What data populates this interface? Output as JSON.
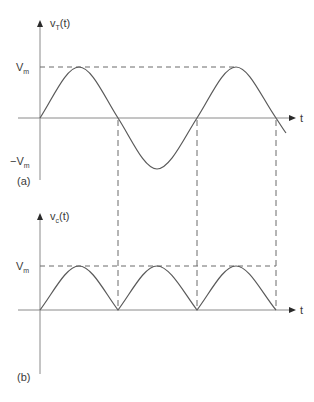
{
  "figure": {
    "panel_a": {
      "tag": "(a)",
      "y_label_main": "v",
      "y_label_sub": "T",
      "y_label_arg": "(t)",
      "x_label": "t",
      "pos_level_main": "V",
      "pos_level_sub": "m",
      "neg_level_main": "−V",
      "neg_level_sub": "m",
      "waveform": "sine, 2 periods shown"
    },
    "panel_b": {
      "tag": "(b)",
      "y_label_main": "v",
      "y_label_sub": "c",
      "y_label_arg": "(t)",
      "x_label": "t",
      "pos_level_main": "V",
      "pos_level_sub": "m",
      "waveform": "full-wave rectified sine |sin|, 3 humps"
    }
  },
  "colors": {
    "axis": "#8a8a8a",
    "curve": "#5a5a5a",
    "dashed": "#6a6a6a",
    "text": "#3a3a3a"
  }
}
